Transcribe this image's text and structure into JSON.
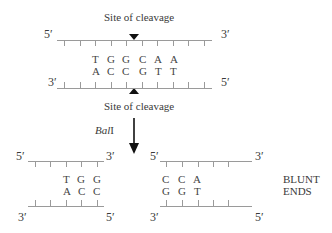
{
  "diagram": {
    "top": {
      "site_label_top": "Site of cleavage",
      "site_label_bottom": "Site of cleavage",
      "upper_strand": {
        "left_end": "5′",
        "right_end": "3′"
      },
      "lower_strand": {
        "left_end": "3′",
        "right_end": "5′"
      },
      "upper_bases": [
        "T",
        "G",
        "G",
        "C",
        "A",
        "A"
      ],
      "lower_bases": [
        "A",
        "C",
        "C",
        "G",
        "T",
        "T"
      ]
    },
    "enzyme": {
      "name": "Bal",
      "suffix": "I"
    },
    "products": {
      "left": {
        "upper_strand": {
          "left_end": "5′",
          "right_end": "3′"
        },
        "lower_strand": {
          "left_end": "3′",
          "right_end": "5′"
        },
        "upper_bases": [
          "T",
          "G",
          "G"
        ],
        "lower_bases": [
          "A",
          "C",
          "C"
        ]
      },
      "right": {
        "upper_strand": {
          "left_end": "5′",
          "right_end": "3′"
        },
        "lower_strand": {
          "left_end": "3′",
          "right_end": "5′"
        },
        "upper_bases": [
          "C",
          "C",
          "A"
        ],
        "lower_bases": [
          "G",
          "G",
          "T"
        ]
      },
      "label_line1": "BLUNT",
      "label_line2": "ENDS"
    }
  }
}
